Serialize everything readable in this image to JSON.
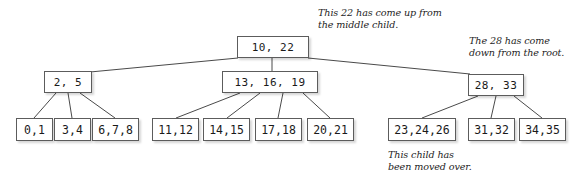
{
  "figure": {
    "width": 578,
    "height": 188,
    "background_color": "#ffffff",
    "box_border_color": "#5c5c5c",
    "edge_color": "#4a4a4a",
    "text_color": "#1a1a1a"
  },
  "tree": {
    "root": {
      "label": "10, 22",
      "x": 237,
      "y": 36,
      "w": 72,
      "h": 22
    },
    "internal": [
      {
        "label": "2, 5",
        "x": 44,
        "y": 71,
        "w": 48,
        "h": 22
      },
      {
        "label": "13, 16, 19",
        "x": 222,
        "y": 71,
        "w": 96,
        "h": 22
      },
      {
        "label": "28, 33",
        "x": 468,
        "y": 74,
        "w": 56,
        "h": 22
      }
    ],
    "leaves": [
      {
        "label": "0,1",
        "x": 16,
        "y": 118,
        "w": 37,
        "h": 23,
        "parent": 0
      },
      {
        "label": "3,4",
        "x": 54,
        "y": 118,
        "w": 37,
        "h": 23,
        "parent": 0
      },
      {
        "label": "6,7,8",
        "x": 92,
        "y": 118,
        "w": 47,
        "h": 23,
        "parent": 0
      },
      {
        "label": "11,12",
        "x": 152,
        "y": 118,
        "w": 47,
        "h": 23,
        "parent": 1
      },
      {
        "label": "14,15",
        "x": 203,
        "y": 118,
        "w": 47,
        "h": 23,
        "parent": 1
      },
      {
        "label": "17,18",
        "x": 255,
        "y": 118,
        "w": 47,
        "h": 23,
        "parent": 1
      },
      {
        "label": "20,21",
        "x": 307,
        "y": 118,
        "w": 47,
        "h": 23,
        "parent": 1
      },
      {
        "label": "23,24,26",
        "x": 388,
        "y": 118,
        "w": 68,
        "h": 23,
        "parent": 2
      },
      {
        "label": "31,32",
        "x": 468,
        "y": 118,
        "w": 47,
        "h": 23,
        "parent": 2
      },
      {
        "label": "34,35",
        "x": 519,
        "y": 118,
        "w": 47,
        "h": 23,
        "parent": 2
      }
    ]
  },
  "annotations": [
    {
      "name": "annotation-22-up",
      "line1": "This 22 has come up from",
      "line2": "the middle child.",
      "x": 318,
      "y": 7
    },
    {
      "name": "annotation-28-down",
      "line1": "The 28 has come",
      "line2": "down from the root.",
      "x": 469,
      "y": 35
    },
    {
      "name": "annotation-child-moved",
      "line1": "This child has",
      "line2": "been moved over.",
      "x": 388,
      "y": 149
    }
  ],
  "edges": [
    {
      "name": "root-to-left-internal",
      "x1": 238,
      "y1": 58,
      "x2": 90,
      "y2": 72
    },
    {
      "name": "root-to-middle-internal",
      "x1": 272,
      "y1": 58,
      "x2": 272,
      "y2": 71
    },
    {
      "name": "root-to-right-internal",
      "x1": 308,
      "y1": 58,
      "x2": 470,
      "y2": 74
    },
    {
      "name": "left-internal-to-leaf-0",
      "x1": 56,
      "y1": 93,
      "x2": 34,
      "y2": 118
    },
    {
      "name": "left-internal-to-leaf-1",
      "x1": 68,
      "y1": 93,
      "x2": 72,
      "y2": 118
    },
    {
      "name": "left-internal-to-leaf-2",
      "x1": 80,
      "y1": 93,
      "x2": 115,
      "y2": 118
    },
    {
      "name": "mid-internal-to-leaf-0",
      "x1": 240,
      "y1": 93,
      "x2": 176,
      "y2": 118
    },
    {
      "name": "mid-internal-to-leaf-1",
      "x1": 260,
      "y1": 93,
      "x2": 227,
      "y2": 118
    },
    {
      "name": "mid-internal-to-leaf-2",
      "x1": 283,
      "y1": 93,
      "x2": 278,
      "y2": 118
    },
    {
      "name": "mid-internal-to-leaf-3",
      "x1": 303,
      "y1": 93,
      "x2": 330,
      "y2": 118
    },
    {
      "name": "right-internal-to-leaf-0",
      "x1": 478,
      "y1": 96,
      "x2": 422,
      "y2": 118
    },
    {
      "name": "right-internal-to-leaf-1",
      "x1": 496,
      "y1": 96,
      "x2": 491,
      "y2": 118
    },
    {
      "name": "right-internal-to-leaf-2",
      "x1": 514,
      "y1": 96,
      "x2": 542,
      "y2": 118
    }
  ]
}
